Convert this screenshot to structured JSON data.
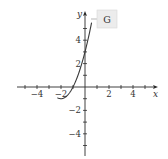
{
  "chart_data": {
    "type": "line",
    "title": "",
    "xlabel": "x",
    "ylabel": "y",
    "xlim": [
      -5.5,
      6
    ],
    "ylim": [
      -6.2,
      6.4
    ],
    "x_ticks": [
      -5,
      -4,
      -3,
      -2,
      -1,
      1,
      2,
      3,
      4,
      5
    ],
    "y_ticks": [
      -5,
      -4,
      -3,
      -2,
      -1,
      1,
      2,
      3,
      4,
      5
    ],
    "x_tick_labels": [
      {
        "value": -4,
        "text": "−4"
      },
      {
        "value": -2,
        "text": "−2"
      },
      {
        "value": 2,
        "text": "2"
      },
      {
        "value": 4,
        "text": "4"
      }
    ],
    "y_tick_labels": [
      {
        "value": 4,
        "text": "4"
      },
      {
        "value": 2,
        "text": "2"
      },
      {
        "value": -2,
        "text": "−2"
      },
      {
        "value": -4,
        "text": "−4"
      }
    ],
    "grid": false,
    "series": [
      {
        "name": "G",
        "function": "(x+2)^2 - 1",
        "x_range": [
          -2.3,
          0.55
        ],
        "points": [
          [
            -2.3,
            -0.91
          ],
          [
            -2,
            -1
          ],
          [
            -1.5,
            -0.75
          ],
          [
            -1,
            0
          ],
          [
            -0.5,
            1.25
          ],
          [
            0,
            3
          ],
          [
            0.5,
            5.25
          ]
        ]
      }
    ],
    "annotations": [
      {
        "text": "G",
        "style": "callout-box",
        "points_to": "curve"
      }
    ]
  }
}
